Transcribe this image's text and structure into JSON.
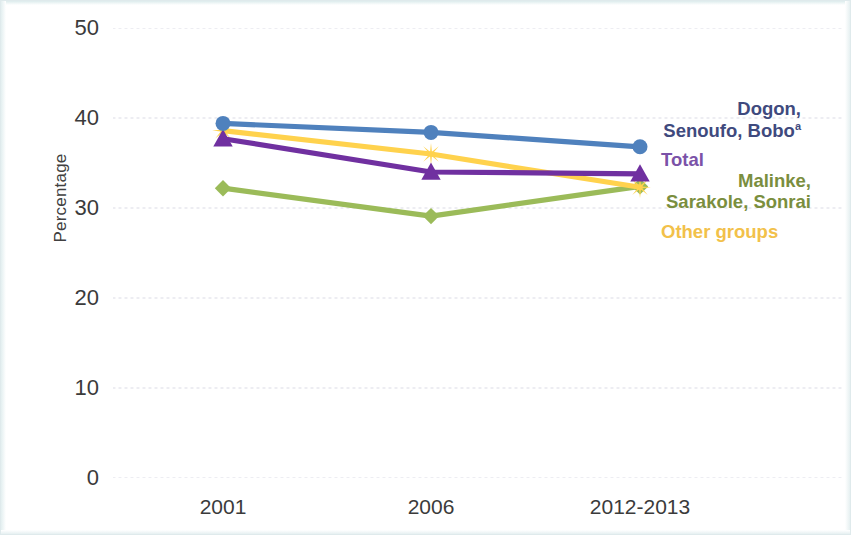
{
  "chart_data": {
    "type": "line",
    "title": "",
    "subtitle": "",
    "xlabel": "",
    "ylabel": "Percentage",
    "categories": [
      "2001",
      "2006",
      "2012-2013"
    ],
    "ylim": [
      0,
      50
    ],
    "yticks": [
      0,
      10,
      20,
      30,
      40,
      50
    ],
    "ytick_labels": [
      "0",
      "10",
      "20",
      "30",
      "40",
      "50"
    ],
    "grid": "horizontal-dotted",
    "legend_position": "right-inline-annotations",
    "series": [
      {
        "name": "Dogon, Senoufo, Boboᵃ",
        "name_plain": "Dogon, Senoufo, Bobo",
        "footnote_marker": "a",
        "color": "#4f81bd",
        "label_color": "#3f4a7e",
        "marker": "circle",
        "values": [
          39.4,
          38.4,
          36.8
        ]
      },
      {
        "name": "Total",
        "color": "#7030a0",
        "label_color": "#7b52a8",
        "marker": "triangle",
        "values": [
          37.7,
          34.0,
          33.8
        ]
      },
      {
        "name": "Malinke, Sarakole, Sonrai",
        "color": "#9bbb59",
        "label_color": "#7a8e3e",
        "marker": "diamond",
        "values": [
          32.2,
          29.1,
          32.4
        ]
      },
      {
        "name": "Other groups",
        "color": "#ffd24d",
        "label_color": "#f2c14a",
        "marker": "star",
        "values": [
          38.6,
          36.0,
          32.3
        ]
      }
    ]
  },
  "axis": {
    "y_title": "Percentage",
    "y_ticks": [
      "50",
      "40",
      "30",
      "20",
      "10",
      "0"
    ],
    "x_ticks": [
      "2001",
      "2006",
      "2012-2013"
    ]
  },
  "legend": {
    "blue_line1": "Dogon,",
    "blue_line2": "Senoufo, Bobo",
    "blue_sup": "a",
    "purple": "Total",
    "green_line1": "Malinke,",
    "green_line2": "Sarakole, Sonrai",
    "yellow": "Other groups"
  },
  "colors": {
    "blue": "#4f81bd",
    "purple": "#7030a0",
    "green": "#9bbb59",
    "yellow": "#ffd24d",
    "grid": "#e8e8ee",
    "text": "#3b3b3b"
  }
}
